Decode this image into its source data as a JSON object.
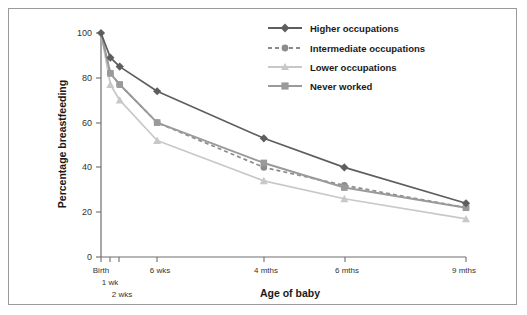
{
  "chart_data": {
    "type": "line",
    "title": "",
    "xlabel": "Age of baby",
    "ylabel": "Percentage breastfeeding",
    "categories": [
      "Birth",
      "1 wk",
      "2 wks",
      "6 wks",
      "4 mths",
      "6 mths",
      "9 mths"
    ],
    "x": [
      0,
      1,
      2,
      6,
      17.4,
      26,
      39
    ],
    "xlim": [
      0,
      39
    ],
    "ylim": [
      0,
      100
    ],
    "yticks": [
      0,
      20,
      40,
      60,
      80,
      100
    ],
    "ytick_labels": [
      "0",
      "20",
      "40",
      "60",
      "80",
      "100"
    ],
    "grid": false,
    "legend_position": "top-right",
    "series": [
      {
        "name": "Higher occupations",
        "values": [
          100,
          89,
          85,
          74,
          53,
          40,
          24
        ],
        "color": "#5e5e5e",
        "marker": "diamond",
        "dash": "solid"
      },
      {
        "name": "Intermediate occupations",
        "values": [
          100,
          82,
          77,
          60,
          40,
          32,
          22
        ],
        "color": "#8c8c8c",
        "marker": "circle",
        "dash": "dashed"
      },
      {
        "name": "Lower occupations",
        "values": [
          100,
          77,
          70,
          52,
          34,
          26,
          17
        ],
        "color": "#c8c8c8",
        "marker": "triangle",
        "dash": "solid"
      },
      {
        "name": "Never worked",
        "values": [
          100,
          82,
          77,
          60,
          42,
          31,
          22
        ],
        "color": "#9a9a9a",
        "marker": "square",
        "dash": "solid"
      }
    ]
  },
  "legend": {
    "items": [
      {
        "label": "Higher occupations"
      },
      {
        "label": "Intermediate occupations"
      },
      {
        "label": "Lower occupations"
      },
      {
        "label": "Never worked"
      }
    ]
  },
  "colors": {
    "axis": "#6e6e6e",
    "frame": "#9a9a9a",
    "text": "#1a1a1a",
    "background": "#ffffff"
  }
}
